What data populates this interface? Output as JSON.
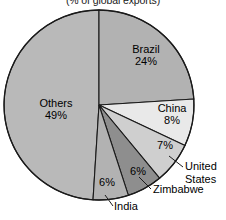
{
  "chart_data": {
    "type": "pie",
    "title": "(% of global exports)",
    "xlabel": "",
    "ylabel": "",
    "legend_position": "none",
    "grid": false,
    "categories": [
      "Brazil",
      "China",
      "United States",
      "Zimbabwe",
      "India",
      "Others"
    ],
    "values": [
      24,
      8,
      7,
      6,
      6,
      49
    ],
    "labels": [
      "24%",
      "8%",
      "7%",
      "6%",
      "6%",
      "49%"
    ],
    "colors": [
      "#b2b2b2",
      "#e9e9e9",
      "#cfcfcf",
      "#8e8e8e",
      "#b2b2b2",
      "#b9b9b9"
    ],
    "slices": [
      {
        "name": "Brazil",
        "value": 24,
        "label": "24%",
        "color": "#b2b2b2",
        "label_placement": "inside"
      },
      {
        "name": "China",
        "value": 8,
        "label": "8%",
        "color": "#e9e9e9",
        "label_placement": "inside"
      },
      {
        "name": "United States",
        "value": 7,
        "label": "7%",
        "color": "#cfcfcf",
        "label_placement": "leader"
      },
      {
        "name": "Zimbabwe",
        "value": 6,
        "label": "6%",
        "color": "#8e8e8e",
        "label_placement": "leader"
      },
      {
        "name": "India",
        "value": 6,
        "label": "6%",
        "color": "#b2b2b2",
        "label_placement": "leader"
      },
      {
        "name": "Others",
        "value": 49,
        "label": "49%",
        "color": "#b9b9b9",
        "label_placement": "inside"
      }
    ],
    "total": 100,
    "units": "percent"
  },
  "labels": {
    "brazil_name": "Brazil",
    "brazil_value": "24%",
    "others_name": "Others",
    "others_value": "49%",
    "china_name": "China",
    "china_value": "8%",
    "us_value": "7%",
    "us_name_line1": "United",
    "us_name_line2": "States",
    "zimbabwe_value": "6%",
    "zimbabwe_name": "Zimbabwe",
    "india_value": "6%",
    "india_name": "India"
  }
}
